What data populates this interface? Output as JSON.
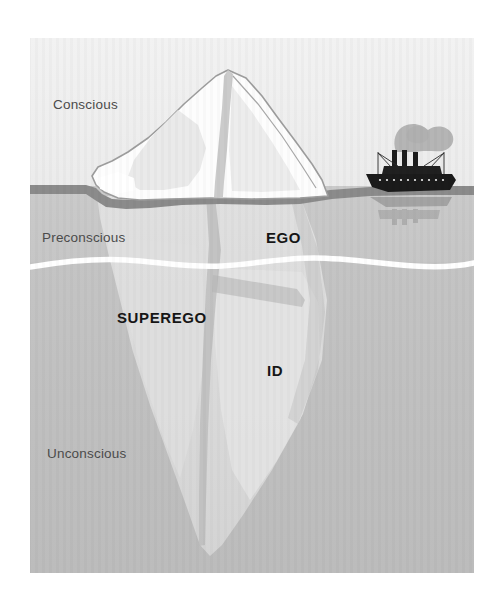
{
  "figure": {
    "name": "freud-iceberg-model",
    "frame": {
      "x": 30,
      "y": 38,
      "width": 444,
      "height": 535
    }
  },
  "colors": {
    "page_background": "#ffffff",
    "sky": "#efefef",
    "sky_shade": "#e6e6e6",
    "water_preconscious": "#c8c8c8",
    "water_unconscious": "#c2c2c2",
    "water_deep": "#bdbdbd",
    "waterline_band": "#8d8d8d",
    "unconscious_divider": "#ffffff",
    "ice_above": "#fdfdfd",
    "ice_shadow": "#e3e3e3",
    "ice_below": "#dcdcdc",
    "ice_below_dark": "#d0d0d0",
    "ice_outline": "#9a9a9a",
    "ship_hull": "#1d1d1d",
    "ship_smoke": "#9b9b9b",
    "label_level": "#4b4b4b",
    "label_structure": "#161616"
  },
  "levels": [
    {
      "id": "conscious",
      "label": "Conscious",
      "x": 53,
      "y": 109
    },
    {
      "id": "preconscious",
      "label": "Preconscious",
      "x": 42,
      "y": 242
    },
    {
      "id": "unconscious",
      "label": "Unconscious",
      "x": 47,
      "y": 458
    }
  ],
  "structures": [
    {
      "id": "ego",
      "label": "EGO",
      "x": 266,
      "y": 243
    },
    {
      "id": "superego",
      "label": "SUPEREGO",
      "x": 117,
      "y": 323
    },
    {
      "id": "id",
      "label": "ID",
      "x": 267,
      "y": 376
    }
  ],
  "scene": {
    "ship": {
      "name": "steamship",
      "funnels": 3,
      "x": 364,
      "y": 148,
      "width": 92,
      "height": 48
    },
    "iceberg": {
      "name": "iceberg",
      "peak_x": 228,
      "peak_y": 70,
      "tip_y": 545
    },
    "waterline_y": 192,
    "unconscious_divider_y": 263
  }
}
